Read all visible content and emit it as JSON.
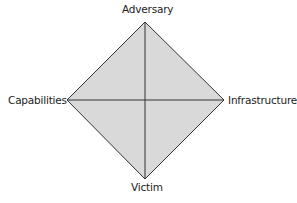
{
  "diagram": {
    "fill_color": "#d9d9d9",
    "stroke_color": "#333333",
    "nodes": {
      "top": {
        "label": "Adversary"
      },
      "left": {
        "label": "Capabilities"
      },
      "right": {
        "label": "Infrastructure"
      },
      "bottom": {
        "label": "Victim"
      }
    },
    "edges": [
      [
        "Adversary",
        "Infrastructure"
      ],
      [
        "Infrastructure",
        "Victim"
      ],
      [
        "Victim",
        "Capabilities"
      ],
      [
        "Capabilities",
        "Adversary"
      ],
      [
        "Adversary",
        "Victim"
      ],
      [
        "Capabilities",
        "Infrastructure"
      ]
    ]
  }
}
